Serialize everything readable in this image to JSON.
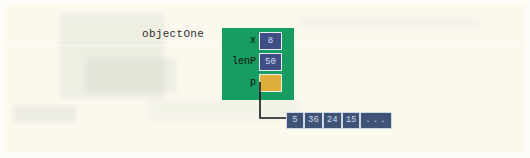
{
  "diagram": {
    "title": "objectOne",
    "object_label": "objectOne",
    "object_color": "#179c62",
    "field_value_color": "#3f4e85",
    "pointer_color": "#dfae3b",
    "array_color": "#3f5377",
    "fields": [
      {
        "label": "x",
        "value": "8",
        "kind": "value"
      },
      {
        "label": "lenP",
        "value": "50",
        "kind": "value"
      },
      {
        "label": "p",
        "value": "",
        "kind": "pointer"
      }
    ],
    "array": {
      "cells": [
        "5",
        "36",
        "24",
        "15"
      ],
      "ellipsis": "..."
    },
    "arrow": {
      "name": "pointer-arrow",
      "from": "p-field",
      "to": "heap-array"
    }
  }
}
